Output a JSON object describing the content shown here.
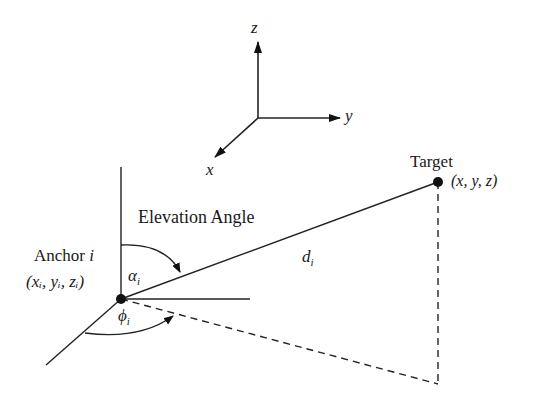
{
  "axes": {
    "z": "z",
    "y": "y",
    "x": "x"
  },
  "labels": {
    "elevation": "Elevation Angle",
    "anchor": "Anchor",
    "anchor_index": "i",
    "anchor_coords": "(xᵢ, yᵢ, zᵢ)",
    "target": "Target",
    "target_coords": "(x, y, z)",
    "distance": "d",
    "distance_sub": "i",
    "alpha": "α",
    "alpha_sub": "i",
    "phi": "ϕ",
    "phi_sub": "i"
  }
}
